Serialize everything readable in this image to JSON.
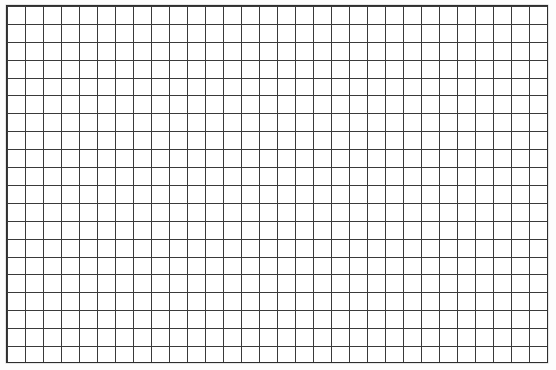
{
  "document": {
    "type": "graph-paper-grid",
    "title": "Blank grid sheet",
    "caption": ""
  },
  "canvas": {
    "width": 556,
    "height": 370,
    "background_color": "#fdfdfd"
  },
  "grid": {
    "columns": 30,
    "rows": 20,
    "cell_width": 18,
    "cell_height": 17.9,
    "offset_left": 6,
    "offset_top": 5,
    "sheet_width": 542,
    "sheet_height": 358,
    "line_color": "#3a3a3a",
    "line_width": 1,
    "border_color": "#2e2e2e",
    "border_width": 1.6,
    "fill_color": "#ffffff",
    "labels": [],
    "annotations": []
  },
  "chart_data": {
    "type": "table",
    "title": "",
    "xlabel": "",
    "ylabel": "",
    "categories": [],
    "values": [],
    "grid": true,
    "legend": null,
    "note": "Empty graph-paper grid: 30 columns by 20 rows of square cells, no plotted data, no tick labels, no legend."
  }
}
